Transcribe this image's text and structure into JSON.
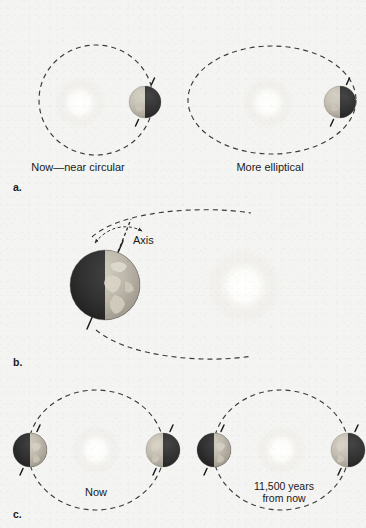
{
  "figure": {
    "background_color": "#f4f4f2",
    "ink_color": "#1a1a1a"
  },
  "panels": [
    {
      "letter": "a.",
      "name": "eccentricity",
      "labels": [
        {
          "text": "Now—near circular",
          "x": 78,
          "y": 168
        },
        {
          "text": "More elliptical",
          "x": 270,
          "y": 168
        }
      ],
      "orbits": [
        {
          "name": "near-circular-orbit",
          "cx": 96,
          "cy": 100,
          "rx": 57,
          "ry": 55
        },
        {
          "name": "elliptical-orbit",
          "cx": 272,
          "cy": 100,
          "rx": 84,
          "ry": 54
        }
      ],
      "suns": [
        {
          "name": "sun-left",
          "cx": 80,
          "cy": 103,
          "r": 19
        },
        {
          "name": "sun-right",
          "cx": 268,
          "cy": 103,
          "r": 19
        }
      ],
      "earths": [
        {
          "name": "earth-left",
          "cx": 145,
          "cy": 102,
          "r": 16,
          "lit_side": "left"
        },
        {
          "name": "earth-right",
          "cx": 340,
          "cy": 102,
          "r": 16,
          "lit_side": "left"
        }
      ]
    },
    {
      "letter": "b.",
      "name": "axial-precession",
      "labels": [
        {
          "text": "Axis",
          "x": 133,
          "y": 241
        }
      ],
      "sun": {
        "name": "sun-center",
        "cx": 244,
        "cy": 286,
        "r": 27
      },
      "earth": {
        "name": "earth-tilted",
        "cx": 105,
        "cy": 285,
        "r": 35,
        "lit_side": "right"
      },
      "axis_tilt_degrees": 23.5
    },
    {
      "letter": "c.",
      "name": "precession-of-equinoxes",
      "labels": [
        {
          "text": "Now",
          "x": 96,
          "y": 492
        },
        {
          "text": "11,500 years",
          "x": 284,
          "y": 488
        },
        {
          "text": "from now",
          "x": 284,
          "y": 500
        }
      ],
      "orbits": [
        {
          "name": "orbit-now",
          "cx": 96,
          "cy": 450,
          "rx": 68,
          "ry": 60
        },
        {
          "name": "orbit-future",
          "cx": 281,
          "cy": 450,
          "rx": 68,
          "ry": 60
        }
      ],
      "suns": [
        {
          "name": "sun-now",
          "cx": 96,
          "cy": 450,
          "r": 18
        },
        {
          "name": "sun-future",
          "cx": 281,
          "cy": 450,
          "r": 18
        }
      ],
      "earths": [
        {
          "name": "earth-now-aphelion",
          "cx": 30,
          "cy": 450,
          "r": 17,
          "lit_side": "right"
        },
        {
          "name": "earth-now-perihelion",
          "cx": 163,
          "cy": 450,
          "r": 17,
          "lit_side": "left"
        },
        {
          "name": "earth-future-aphelion",
          "cx": 214,
          "cy": 450,
          "r": 17,
          "lit_side": "right"
        },
        {
          "name": "earth-future-perihelion",
          "cx": 348,
          "cy": 450,
          "r": 17,
          "lit_side": "left"
        }
      ]
    }
  ],
  "panel_letters": {
    "a": "a.",
    "b": "b.",
    "c": "c."
  },
  "colors": {
    "orbit_stroke": "#3b3b3b",
    "earth_lit": "#b9b4a9",
    "earth_dark": "#2e2e2e",
    "sun_core": "#ffffff",
    "sun_halo": "#eceae5"
  }
}
